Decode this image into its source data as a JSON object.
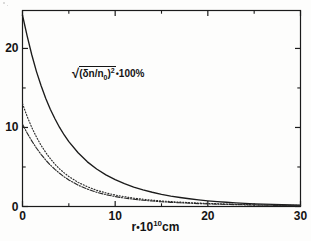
{
  "chart_data": {
    "type": "line",
    "title": "",
    "annotation": {
      "text": "sqrt((δn/n_0)^2) * 100%",
      "radical": "√",
      "base": "(δn/n",
      "sub": "0",
      "close": ")",
      "exponent": "2",
      "times": "•",
      "percent": "100%"
    },
    "xlabel": "r•10¹⁰cm",
    "xlabel_parts": {
      "prefix": "r",
      "dot": "•",
      "base": "10",
      "exponent": "10",
      "unit": "cm"
    },
    "ylabel": "",
    "xlim": [
      0,
      30
    ],
    "ylim": [
      0,
      24.8
    ],
    "xticks": [
      0,
      10,
      20,
      30
    ],
    "xticks_minor": [
      5,
      15,
      25
    ],
    "yticks": [
      0,
      10,
      20
    ],
    "yticks_minor": [
      5,
      15,
      25
    ],
    "xtick_labels": [
      "0",
      "10",
      "20",
      "30"
    ],
    "ytick_labels": [
      "0",
      "10",
      "20"
    ],
    "grid": false,
    "legend_position": "none",
    "frame": "box",
    "series": [
      {
        "name": "solid",
        "style": "solid",
        "color": "#1b1b1b",
        "x": [
          0.0,
          0.5,
          1.0,
          1.5,
          2.0,
          2.5,
          3.0,
          3.5,
          4.0,
          4.5,
          5.0,
          6.0,
          7.0,
          8.0,
          9.0,
          10.0,
          11.0,
          12.0,
          13.0,
          14.0,
          15.0,
          16.0,
          17.0,
          18.0,
          19.0,
          20.0,
          21.0,
          22.0,
          23.0,
          24.0,
          25.0,
          26.0,
          27.0,
          28.0,
          29.0,
          30.0
        ],
        "y": [
          24.2,
          21.6,
          19.2,
          17.1,
          15.3,
          13.7,
          12.3,
          11.1,
          10.0,
          9.05,
          8.2,
          6.8,
          5.65,
          4.75,
          4.0,
          3.4,
          2.88,
          2.45,
          2.1,
          1.8,
          1.54,
          1.32,
          1.14,
          0.98,
          0.84,
          0.72,
          0.62,
          0.54,
          0.46,
          0.4,
          0.34,
          0.3,
          0.26,
          0.22,
          0.19,
          0.17
        ]
      },
      {
        "name": "dotted",
        "style": "dotted",
        "color": "#2a2a2a",
        "x": [
          0.0,
          0.5,
          1.0,
          1.5,
          2.0,
          2.5,
          3.0,
          3.5,
          4.0,
          4.5,
          5.0,
          6.0,
          7.0,
          8.0,
          9.0,
          10.0,
          11.0,
          12.0,
          13.0,
          14.0,
          15.0,
          16.0,
          17.0,
          18.0,
          19.0,
          20.0,
          21.0,
          22.0,
          23.0,
          24.0,
          25.0,
          26.0,
          27.0,
          28.0,
          29.0,
          30.0
        ],
        "y": [
          13.0,
          11.4,
          10.0,
          8.8,
          7.75,
          6.85,
          6.05,
          5.35,
          4.75,
          4.25,
          3.8,
          3.05,
          2.5,
          2.05,
          1.72,
          1.45,
          1.24,
          1.06,
          0.92,
          0.8,
          0.7,
          0.62,
          0.55,
          0.49,
          0.44,
          0.39,
          0.35,
          0.31,
          0.28,
          0.25,
          0.22,
          0.2,
          0.18,
          0.16,
          0.15,
          0.13
        ]
      },
      {
        "name": "dash-dot",
        "style": "dashdot",
        "color": "#2a2a2a",
        "x": [
          0.0,
          0.5,
          1.0,
          1.5,
          2.0,
          2.5,
          3.0,
          3.5,
          4.0,
          4.5,
          5.0,
          6.0,
          7.0,
          8.0,
          9.0,
          10.0,
          11.0,
          12.0,
          13.0,
          14.0,
          15.0,
          16.0,
          17.0,
          18.0,
          19.0,
          20.0,
          21.0,
          22.0,
          23.0,
          24.0,
          25.0,
          26.0,
          27.0,
          28.0,
          29.0,
          30.0
        ],
        "y": [
          10.4,
          9.3,
          8.3,
          7.4,
          6.6,
          5.88,
          5.25,
          4.7,
          4.2,
          3.75,
          3.36,
          2.7,
          2.2,
          1.8,
          1.5,
          1.26,
          1.07,
          0.92,
          0.79,
          0.69,
          0.6,
          0.53,
          0.47,
          0.42,
          0.37,
          0.33,
          0.3,
          0.27,
          0.24,
          0.21,
          0.19,
          0.17,
          0.15,
          0.14,
          0.12,
          0.11
        ]
      }
    ]
  }
}
